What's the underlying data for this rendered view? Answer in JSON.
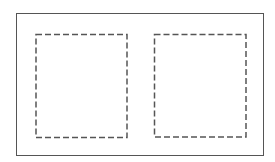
{
  "diagram": {
    "outer_frame": {
      "stroke": "#555555"
    },
    "panels": [
      {
        "id": "left",
        "stroke": "#555555",
        "style": "dashed"
      },
      {
        "id": "right",
        "stroke": "#555555",
        "style": "dashed"
      }
    ]
  }
}
